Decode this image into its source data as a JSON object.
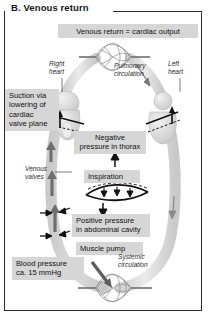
{
  "figure": {
    "panel_letter": "B.",
    "title": "B.  Venous return",
    "banner": "Venous return = cardiac output"
  },
  "labels": {
    "suction": "Suction via\nlowering of\ncardiac\nvalve plane",
    "negative_pressure": "Negative\npressure in thorax",
    "inspiration": "Inspiration",
    "positive_pressure": "Positive pressure\nin abdominal cavity",
    "muscle_pump": "Muscle pump",
    "blood_pressure": "Blood pressure\nca. 15 mmHg"
  },
  "annotations": {
    "right_heart": "Right\nheart",
    "left_heart": "Left\nheart",
    "pulmonary_circulation": "Pulmonary\ncirculation",
    "venous_valves": "Venous\nvalves",
    "systemic_circulation": "Systemic\ncirculation"
  },
  "colors": {
    "label_box": "#d6d6d6",
    "vessel": "#d9d9d9",
    "vessel_stroke": "#bdbdbd",
    "ink": "#161616",
    "frame": "#2b2b2b",
    "capillary": "#8a8a8a"
  },
  "icons": {
    "up_arrow": "up-arrow-icon",
    "down_arrow": "down-arrow-icon",
    "flow_arrow": "flow-arrow-icon",
    "diaphragm": "diaphragm-icon",
    "capillary_network": "capillary-network-icon",
    "heart": "heart-icon"
  }
}
